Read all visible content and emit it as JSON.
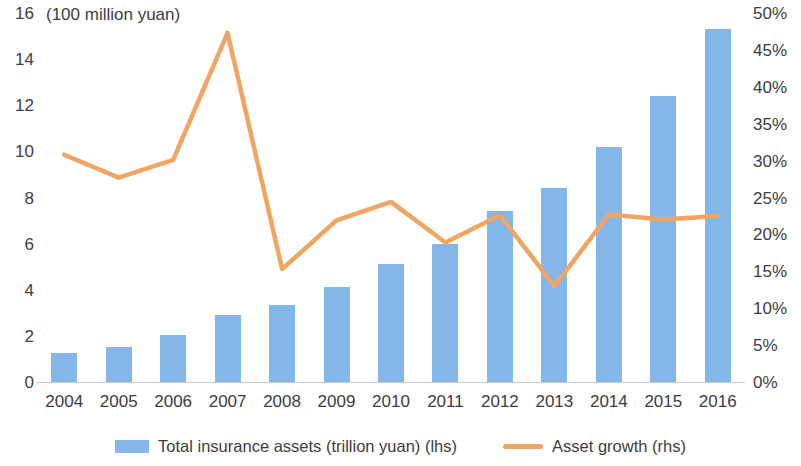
{
  "units_note": "(100 million yuan)",
  "legend": {
    "bar_label": "Total insurance assets (trillion yuan) (lhs)",
    "line_label": "Asset growth (rhs)",
    "bar_color": "#83b7ea",
    "line_color": "#f0a562"
  },
  "chart_data": {
    "type": "bar",
    "title": "",
    "subtitle": "(100 million yuan)",
    "xlabel": "",
    "ylabel": "",
    "grid": false,
    "legend_position": "bottom",
    "categories": [
      "2004",
      "2005",
      "2006",
      "2007",
      "2008",
      "2009",
      "2010",
      "2011",
      "2012",
      "2013",
      "2014",
      "2015",
      "2016"
    ],
    "series": [
      {
        "name": "Total insurance assets (trillion yuan) (lhs)",
        "type": "bar",
        "axis": "left",
        "color": "#83b7ea",
        "values": [
          1.25,
          1.5,
          2.05,
          2.9,
          3.35,
          4.1,
          5.1,
          6.0,
          7.4,
          8.4,
          10.2,
          12.4,
          15.3
        ]
      },
      {
        "name": "Asset growth (rhs)",
        "type": "line",
        "axis": "right",
        "color": "#f0a562",
        "values": [
          30.8,
          27.7,
          30.1,
          47.3,
          15.3,
          21.9,
          24.4,
          18.9,
          22.6,
          13.0,
          22.7,
          22.0,
          22.5
        ]
      }
    ],
    "y_left": {
      "min": 0,
      "max": 16,
      "step": 2,
      "ticks": [
        "0",
        "2",
        "4",
        "6",
        "8",
        "10",
        "12",
        "14",
        "16"
      ],
      "unit_note": "(100 million yuan)"
    },
    "y_right": {
      "min": 0,
      "max": 50,
      "step": 5,
      "ticks": [
        "0%",
        "5%",
        "10%",
        "15%",
        "20%",
        "25%",
        "30%",
        "35%",
        "40%",
        "45%",
        "50%"
      ],
      "suffix": "%"
    }
  }
}
